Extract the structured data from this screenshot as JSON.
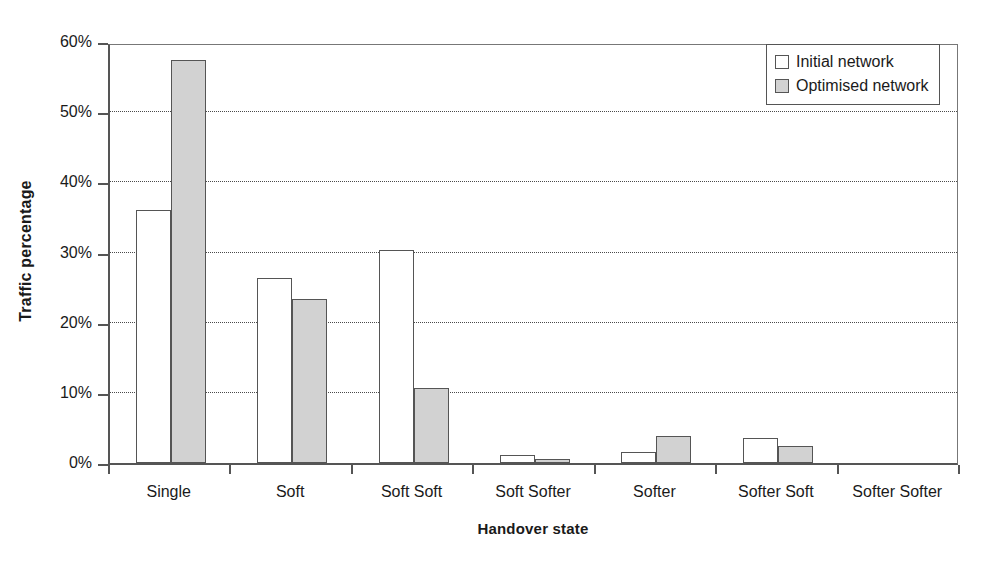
{
  "chart_data": {
    "type": "bar",
    "title": "",
    "xlabel": "Handover state",
    "ylabel": "Traffic percentage",
    "categories": [
      "Single",
      "Soft",
      "Soft Soft",
      "Soft Softer",
      "Softer",
      "Softer Soft",
      "Softer Softer"
    ],
    "series": [
      {
        "name": "Initial network",
        "color": "#ffffff",
        "values": [
          36.0,
          26.3,
          30.3,
          1.1,
          1.6,
          3.6,
          0.0
        ]
      },
      {
        "name": "Optimised network",
        "color": "#d2d2d2",
        "values": [
          57.5,
          23.4,
          10.7,
          0.6,
          3.9,
          2.4,
          0.0
        ]
      }
    ],
    "ylim": [
      0,
      60
    ],
    "ytick_values": [
      0,
      10,
      20,
      30,
      40,
      50,
      60
    ],
    "ytick_labels": [
      "0%",
      "10%",
      "20%",
      "30%",
      "40%",
      "50%",
      "60%"
    ],
    "grid": "horizontal-dotted",
    "legend_position": "top-right",
    "value_format": "percent"
  },
  "axes": {
    "y_title": "Traffic percentage",
    "x_title": "Handover state"
  },
  "legend": {
    "entries": [
      {
        "label": "Initial network",
        "swatch": "initial"
      },
      {
        "label": "Optimised network",
        "swatch": "optimised"
      }
    ]
  }
}
